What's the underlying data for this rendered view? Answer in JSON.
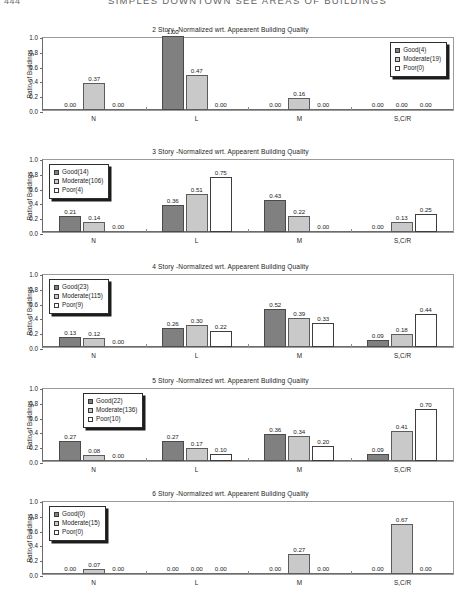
{
  "header": {
    "page_number": "444",
    "running_title": "SIMPLES DOWNTOWN SEE AREAS OF BUILDINGS"
  },
  "axis": {
    "ylabel": "Ratio of Buildings",
    "yticks": [
      "1.0",
      "0.8",
      "0.6",
      "0.4",
      "0.2",
      "0.0"
    ],
    "categories": [
      "N",
      "L",
      "M",
      "S,C/R"
    ]
  },
  "colors": {
    "good": "#808080",
    "moderate": "#c9c9c9",
    "poor": "#ffffff",
    "outline": "#3a3a3a"
  },
  "chart_data": [
    {
      "type": "bar",
      "title": "2 Story -Normalized wrt. Appearent Building Quality",
      "xlabel": "",
      "ylabel": "Ratio of Buildings",
      "ylim": [
        0,
        1.0
      ],
      "categories": [
        "N",
        "L",
        "M",
        "S,C/R"
      ],
      "legend_position": "top-right",
      "series": [
        {
          "name": "Good(4)",
          "key": "good",
          "values": [
            0.0,
            1.0,
            0.0,
            0.0
          ],
          "labels": [
            "0.00",
            "1.00",
            "0.00",
            "0.00"
          ]
        },
        {
          "name": "Moderate(19)",
          "key": "moderate",
          "values": [
            0.37,
            0.47,
            0.16,
            0.0
          ],
          "labels": [
            "0.37",
            "0.47",
            "0.16",
            "0.00"
          ]
        },
        {
          "name": "Poor(0)",
          "key": "poor",
          "values": [
            0.0,
            0.0,
            0.0,
            0.0
          ],
          "labels": [
            "0.00",
            "0.00",
            "0.00",
            "0.00"
          ]
        }
      ]
    },
    {
      "type": "bar",
      "title": "3 Story -Normalized wrt. Appearent Building Quality",
      "xlabel": "",
      "ylabel": "Ratio of Buildings",
      "ylim": [
        0,
        1.0
      ],
      "categories": [
        "N",
        "L",
        "M",
        "S,C/R"
      ],
      "legend_position": "top-left",
      "series": [
        {
          "name": "Good(14)",
          "key": "good",
          "values": [
            0.21,
            0.36,
            0.43,
            0.0
          ],
          "labels": [
            "0.21",
            "0.36",
            "0.43",
            "0.00"
          ]
        },
        {
          "name": "Moderate(106)",
          "key": "moderate",
          "values": [
            0.14,
            0.51,
            0.22,
            0.13
          ],
          "labels": [
            "0.14",
            "0.51",
            "0.22",
            "0.13"
          ]
        },
        {
          "name": "Poor(4)",
          "key": "poor",
          "values": [
            0.0,
            0.75,
            0.0,
            0.25
          ],
          "labels": [
            "0.00",
            "0.75",
            "0.00",
            "0.25"
          ]
        }
      ]
    },
    {
      "type": "bar",
      "title": "4 Story -Normalized wrt. Appearent Building Quality",
      "xlabel": "",
      "ylabel": "Ratio of Buildings",
      "ylim": [
        0,
        1.0
      ],
      "categories": [
        "N",
        "L",
        "M",
        "S,C/R"
      ],
      "legend_position": "top-left",
      "series": [
        {
          "name": "Good(23)",
          "key": "good",
          "values": [
            0.13,
            0.26,
            0.52,
            0.09
          ],
          "labels": [
            "0.13",
            "0.26",
            "0.52",
            "0.09"
          ]
        },
        {
          "name": "Moderate(115)",
          "key": "moderate",
          "values": [
            0.12,
            0.3,
            0.39,
            0.18
          ],
          "labels": [
            "0.12",
            "0.30",
            "0.39",
            "0.18"
          ]
        },
        {
          "name": "Poor(9)",
          "key": "poor",
          "values": [
            0.0,
            0.22,
            0.33,
            0.44
          ],
          "labels": [
            "0.00",
            "0.22",
            "0.33",
            "0.44"
          ]
        }
      ]
    },
    {
      "type": "bar",
      "title": "5 Story -Normalized wrt. Appearent Building Quality",
      "xlabel": "",
      "ylabel": "Ratio of Buildings",
      "ylim": [
        0,
        1.0
      ],
      "categories": [
        "N",
        "L",
        "M",
        "S,C/R"
      ],
      "legend_position": "top-center-left",
      "series": [
        {
          "name": "Good(22)",
          "key": "good",
          "values": [
            0.27,
            0.27,
            0.36,
            0.09
          ],
          "labels": [
            "0.27",
            "0.27",
            "0.36",
            "0.09"
          ]
        },
        {
          "name": "Moderate(136)",
          "key": "moderate",
          "values": [
            0.08,
            0.17,
            0.34,
            0.41
          ],
          "labels": [
            "0.08",
            "0.17",
            "0.34",
            "0.41"
          ]
        },
        {
          "name": "Poor(10)",
          "key": "poor",
          "values": [
            0.0,
            0.1,
            0.2,
            0.7
          ],
          "labels": [
            "0.00",
            "0.10",
            "0.20",
            "0.70"
          ]
        }
      ]
    },
    {
      "type": "bar",
      "title": "6 Story -Normalized wrt. Appearent Building Quality",
      "xlabel": "",
      "ylabel": "Ratio of Buildings",
      "ylim": [
        0,
        1.0
      ],
      "categories": [
        "N",
        "L",
        "M",
        "S,C/R"
      ],
      "legend_position": "top-left",
      "series": [
        {
          "name": "Good(0)",
          "key": "good",
          "values": [
            0.0,
            0.0,
            0.0,
            0.0
          ],
          "labels": [
            "0.00",
            "0.00",
            "0.00",
            "0.00"
          ]
        },
        {
          "name": "Moderate(15)",
          "key": "moderate",
          "values": [
            0.07,
            0.0,
            0.27,
            0.67
          ],
          "labels": [
            "0.07",
            "0.00",
            "0.27",
            "0.67"
          ]
        },
        {
          "name": "Poor(0)",
          "key": "poor",
          "values": [
            0.0,
            0.0,
            0.0,
            0.0
          ],
          "labels": [
            "0.00",
            "0.00",
            "0.00",
            "0.00"
          ]
        }
      ]
    }
  ]
}
